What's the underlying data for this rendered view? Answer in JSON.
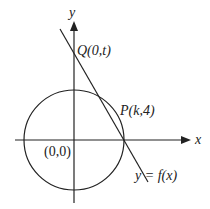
{
  "diagram": {
    "type": "coordinate-geometry",
    "axes": {
      "x_label": "x",
      "y_label": "y"
    },
    "origin_label": "(0,0)",
    "points": {
      "Q": {
        "label": "Q(0,t)"
      },
      "P": {
        "label": "P(k,4)"
      }
    },
    "line_label": "y = f(x)",
    "colors": {
      "stroke": "#222222",
      "background": "#ffffff"
    }
  }
}
